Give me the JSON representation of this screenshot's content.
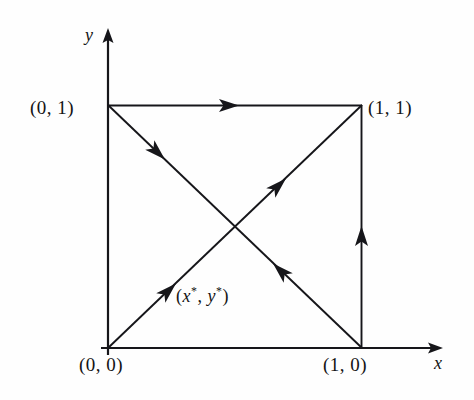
{
  "figure": {
    "name": "unit-square-best-response-diagram",
    "background_color": "#fefefe",
    "ink_color": "#16161a",
    "width": 474,
    "height": 400
  },
  "axes": {
    "x": {
      "label": "x",
      "origin_px": [
        108,
        348
      ],
      "tip_px": [
        443,
        348
      ]
    },
    "y": {
      "label": "y",
      "origin_px": [
        108,
        348
      ],
      "tip_px": [
        108,
        28
      ]
    }
  },
  "vertices": {
    "bottom_left": {
      "label": "(0, 0)",
      "point": [
        0,
        0
      ],
      "px": [
        108,
        348
      ]
    },
    "bottom_right": {
      "label": "(1, 0)",
      "point": [
        1,
        0
      ],
      "px": [
        362,
        348
      ]
    },
    "top_left": {
      "label": "(0, 1)",
      "point": [
        0,
        1
      ],
      "px": [
        108,
        105
      ]
    },
    "top_right": {
      "label": "(1, 1)",
      "point": [
        1,
        1
      ],
      "px": [
        362,
        105
      ]
    }
  },
  "interior_point": {
    "label": "(x*, y*)",
    "label_parts": {
      "open": "(",
      "x": "x",
      "star": "*",
      "comma": ",",
      "y": "y",
      "close": ")"
    },
    "px": [
      205,
      255
    ]
  },
  "edges": [
    {
      "name": "top-edge",
      "from": "(0, 1)",
      "to": "(1, 1)",
      "from_px": [
        108,
        105
      ],
      "to_px": [
        362,
        105
      ],
      "arrow": {
        "direction": "right",
        "at_px": [
          228,
          105
        ]
      }
    },
    {
      "name": "right-edge",
      "from": "(1, 0)",
      "to": "(1, 1)",
      "from_px": [
        362,
        348
      ],
      "to_px": [
        362,
        105
      ],
      "arrow": {
        "direction": "up",
        "at_px": [
          362,
          238
        ]
      }
    },
    {
      "name": "left-edge",
      "from": "(0, 0)",
      "to": "(0, 1)",
      "from_px": [
        108,
        348
      ],
      "to_px": [
        108,
        105
      ],
      "arrow": null
    },
    {
      "name": "bottom-edge",
      "from": "(0, 0)",
      "to": "(1, 0)",
      "from_px": [
        108,
        348
      ],
      "to_px": [
        362,
        348
      ],
      "arrow": null
    }
  ],
  "diagonals": [
    {
      "name": "descending-diagonal",
      "from": "(0, 1)",
      "to": "(1, 0)",
      "from_px": [
        108,
        105
      ],
      "to_px": [
        362,
        348
      ],
      "arrows": [
        {
          "direction": "down-right",
          "at_px": [
            155,
            150
          ]
        },
        {
          "direction": "up-left",
          "at_px": [
            283,
            273
          ]
        }
      ]
    },
    {
      "name": "ascending-diagonal",
      "from": "(0, 0)",
      "to": "(1, 1)",
      "from_px": [
        108,
        348
      ],
      "to_px": [
        362,
        105
      ],
      "arrows": [
        {
          "direction": "up-right",
          "at_px": [
            166,
            293
          ]
        },
        {
          "direction": "up-right",
          "at_px": [
            276,
            188
          ]
        }
      ]
    }
  ]
}
